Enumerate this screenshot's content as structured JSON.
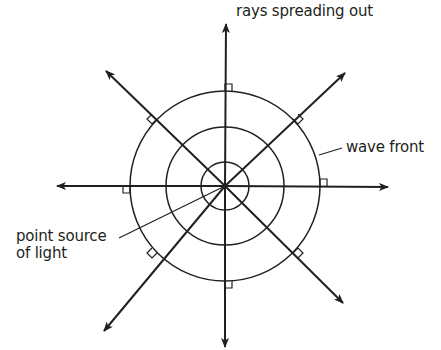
{
  "diagram": {
    "labels": {
      "rays": "rays spreading out",
      "wave_front": "wave front",
      "point_source_line1": "point source",
      "point_source_line2": "of light"
    },
    "center": [
      225,
      186
    ],
    "circles": [
      {
        "name": "inner-wave-front",
        "r": 24
      },
      {
        "name": "middle-wave-front",
        "r": 59
      },
      {
        "name": "outer-wave-front",
        "r": 95
      }
    ],
    "rays": [
      {
        "name": "ray-up",
        "angle_deg": 90,
        "tip": [
          226,
          24
        ]
      },
      {
        "name": "ray-down",
        "angle_deg": 270,
        "tip": [
          225,
          347
        ]
      },
      {
        "name": "ray-left",
        "angle_deg": 180,
        "tip": [
          57,
          186
        ]
      },
      {
        "name": "ray-right",
        "angle_deg": 0,
        "tip": [
          388,
          187
        ]
      },
      {
        "name": "ray-up-left",
        "angle_deg": 135,
        "tip": [
          106,
          71
        ]
      },
      {
        "name": "ray-up-right",
        "angle_deg": 45,
        "tip": [
          345,
          73
        ]
      },
      {
        "name": "ray-down-right",
        "angle_deg": 315,
        "tip": [
          343,
          303
        ]
      },
      {
        "name": "ray-down-left",
        "angle_deg": 225,
        "tip": [
          104,
          331
        ]
      }
    ],
    "colors": {
      "stroke": "#231f20",
      "text": "#231f20",
      "background": "#ffffff"
    }
  }
}
